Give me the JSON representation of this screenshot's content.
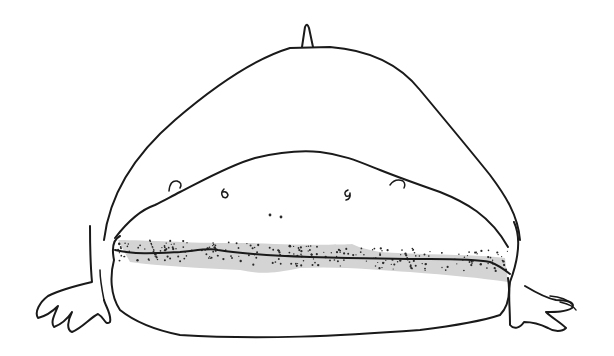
{
  "illustration": {
    "subject": "blobfish line drawing",
    "background_color": "#ffffff",
    "ink_color": "#1a1a1a",
    "lip_shade_color": "#d4d4d4"
  }
}
